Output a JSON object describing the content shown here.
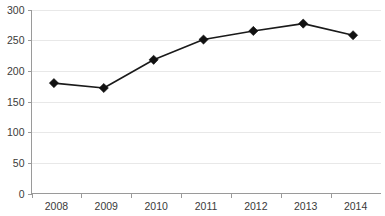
{
  "chart_data": {
    "type": "line",
    "title": "",
    "subtitle": "",
    "xlabel": "",
    "ylabel": "",
    "categories": [
      "2008",
      "2009",
      "2010",
      "2011",
      "2012",
      "2013",
      "2014"
    ],
    "values": [
      180,
      172,
      218,
      251,
      265,
      277,
      258
    ],
    "series": [
      {
        "name": "",
        "values": [
          180,
          172,
          218,
          251,
          265,
          277,
          258
        ]
      }
    ],
    "ylim": [
      0,
      300
    ],
    "ytick_labels": [
      "0",
      "50",
      "100",
      "150",
      "200",
      "250",
      "300"
    ],
    "ytick_values": [
      0,
      50,
      100,
      150,
      200,
      250,
      300
    ],
    "xtick_labels": [
      "2008",
      "2009",
      "2010",
      "2011",
      "2012",
      "2013",
      "2014"
    ],
    "grid": true,
    "grid_axis": "y",
    "legend": false,
    "legend_position": "none",
    "marker": "diamond",
    "colors": {
      "line": "#1a1a1a",
      "marker": "#111111",
      "gridline": "#e8e8e8",
      "axis": "#9a9a9a",
      "tick_text": "#3a3a3a",
      "background": "#ffffff"
    }
  }
}
